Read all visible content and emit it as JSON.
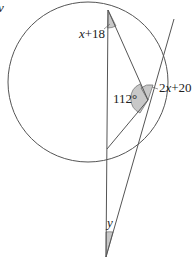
{
  "diagram": {
    "type": "circle-geometry",
    "labels": {
      "corner_glyph": "v",
      "top_angle": "x+18",
      "tangent_angle": "2x+20",
      "interior_angle": "112°",
      "apex_angle": "y"
    },
    "colors": {
      "stroke": "#555555",
      "shade": "#c8c8c8"
    },
    "points": {
      "circle_center": [
        86,
        88
      ],
      "circle_radius": 79,
      "A_top": [
        108,
        10
      ],
      "T_tangent": [
        148,
        100
      ],
      "C_lower": [
        107,
        149
      ],
      "P_apex": [
        106,
        257
      ],
      "tangent_end": [
        174,
        19
      ]
    }
  }
}
